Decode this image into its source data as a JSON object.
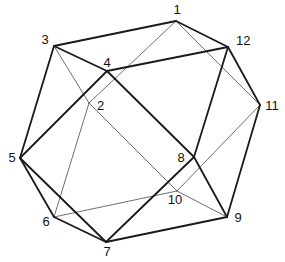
{
  "diagram": {
    "title": "",
    "type": "polyhedron-wireframe",
    "vertices": [
      {
        "id": "1",
        "x": 176,
        "y": 21,
        "label": "1",
        "lx": 177,
        "ly": 14,
        "anchor": "middle"
      },
      {
        "id": "2",
        "x": 89,
        "y": 103,
        "label": "2",
        "lx": 97,
        "ly": 110,
        "anchor": "start"
      },
      {
        "id": "3",
        "x": 54,
        "y": 46,
        "label": "3",
        "lx": 45,
        "ly": 44,
        "anchor": "middle"
      },
      {
        "id": "4",
        "x": 107,
        "y": 71,
        "label": "4",
        "lx": 107,
        "ly": 67,
        "anchor": "middle"
      },
      {
        "id": "5",
        "x": 20,
        "y": 158,
        "label": "5",
        "lx": 12,
        "ly": 162,
        "anchor": "middle"
      },
      {
        "id": "6",
        "x": 54,
        "y": 217,
        "label": "6",
        "lx": 46,
        "ly": 226,
        "anchor": "middle"
      },
      {
        "id": "7",
        "x": 106,
        "y": 242,
        "label": "7",
        "lx": 107,
        "ly": 256,
        "anchor": "middle"
      },
      {
        "id": "8",
        "x": 194,
        "y": 157,
        "label": "8",
        "lx": 181,
        "ly": 162,
        "anchor": "middle"
      },
      {
        "id": "9",
        "x": 227,
        "y": 217,
        "label": "9",
        "lx": 238,
        "ly": 222,
        "anchor": "middle"
      },
      {
        "id": "10",
        "x": 177,
        "y": 191,
        "label": "10",
        "lx": 175,
        "ly": 204,
        "anchor": "middle"
      },
      {
        "id": "11",
        "x": 260,
        "y": 105,
        "label": "11",
        "lx": 272,
        "ly": 110,
        "anchor": "middle"
      },
      {
        "id": "12",
        "x": 228,
        "y": 47,
        "label": "12",
        "lx": 236,
        "ly": 45,
        "anchor": "start"
      }
    ],
    "visible_edges": [
      [
        "1",
        "3"
      ],
      [
        "1",
        "12"
      ],
      [
        "3",
        "4"
      ],
      [
        "4",
        "12"
      ],
      [
        "3",
        "5"
      ],
      [
        "4",
        "5"
      ],
      [
        "12",
        "11"
      ],
      [
        "12",
        "8"
      ],
      [
        "4",
        "8"
      ],
      [
        "8",
        "7"
      ],
      [
        "8",
        "9"
      ],
      [
        "11",
        "9"
      ],
      [
        "5",
        "6"
      ],
      [
        "5",
        "7"
      ],
      [
        "6",
        "7"
      ],
      [
        "7",
        "9"
      ]
    ],
    "hidden_edges": [
      [
        "1",
        "2"
      ],
      [
        "1",
        "11"
      ],
      [
        "3",
        "2"
      ],
      [
        "2",
        "6"
      ],
      [
        "2",
        "10"
      ],
      [
        "6",
        "10"
      ],
      [
        "10",
        "9"
      ],
      [
        "10",
        "11"
      ]
    ],
    "colors": {
      "visible_edge": "#1a1a1a",
      "hidden_edge": "#4a4a4a",
      "label": "#111111",
      "background": "#ffffff"
    }
  }
}
